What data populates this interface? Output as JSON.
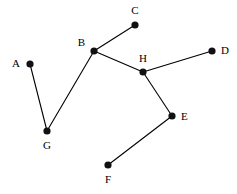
{
  "figure": {
    "width": 237,
    "height": 194,
    "background_color": "#ffffff",
    "node_color": "#111111",
    "edge_color": "#000000",
    "label_color": "#000000",
    "node_radius": 3.6,
    "edge_width": 1.1
  },
  "nodes": [
    {
      "id": "A",
      "label": "A",
      "x": 30,
      "y": 64,
      "label_x": 20,
      "label_y": 64,
      "label_anchor": "left"
    },
    {
      "id": "B",
      "label": "B",
      "x": 94,
      "y": 51,
      "label_x": 85,
      "label_y": 43,
      "label_anchor": "left"
    },
    {
      "id": "C",
      "label": "C",
      "x": 135,
      "y": 25,
      "label_x": 135,
      "label_y": 11,
      "label_anchor": "center"
    },
    {
      "id": "D",
      "label": "D",
      "x": 212,
      "y": 51,
      "label_x": 221,
      "label_y": 51,
      "label_anchor": "right"
    },
    {
      "id": "E",
      "label": "E",
      "x": 172,
      "y": 116,
      "label_x": 181,
      "label_y": 117,
      "label_anchor": "right"
    },
    {
      "id": "F",
      "label": "F",
      "x": 108,
      "y": 165,
      "label_x": 108,
      "label_y": 180,
      "label_anchor": "center"
    },
    {
      "id": "G",
      "label": "G",
      "x": 47,
      "y": 131,
      "label_x": 47,
      "label_y": 146,
      "label_anchor": "center"
    },
    {
      "id": "H",
      "label": "H",
      "x": 143,
      "y": 72,
      "label_x": 143,
      "label_y": 59,
      "label_anchor": "center"
    }
  ],
  "edges": [
    {
      "id": "A-G",
      "from": "A",
      "to": "G",
      "x1": 30,
      "y1": 64,
      "x2": 47,
      "y2": 131
    },
    {
      "id": "G-B",
      "from": "G",
      "to": "B",
      "x1": 47,
      "y1": 131,
      "x2": 94,
      "y2": 51
    },
    {
      "id": "B-C",
      "from": "B",
      "to": "C",
      "x1": 94,
      "y1": 51,
      "x2": 135,
      "y2": 25
    },
    {
      "id": "B-H",
      "from": "B",
      "to": "H",
      "x1": 94,
      "y1": 51,
      "x2": 143,
      "y2": 72
    },
    {
      "id": "H-D",
      "from": "H",
      "to": "D",
      "x1": 143,
      "y1": 72,
      "x2": 212,
      "y2": 51
    },
    {
      "id": "H-E",
      "from": "H",
      "to": "E",
      "x1": 143,
      "y1": 72,
      "x2": 172,
      "y2": 116
    },
    {
      "id": "E-F",
      "from": "E",
      "to": "F",
      "x1": 172,
      "y1": 116,
      "x2": 108,
      "y2": 165
    }
  ]
}
